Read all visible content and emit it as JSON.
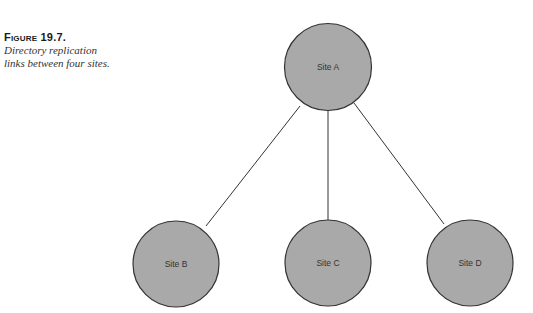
{
  "caption": {
    "figure_label": "Figure 19.7.",
    "text_line1": "Directory replication",
    "text_line2": "links between four sites."
  },
  "diagram": {
    "node_fill": "#a9a9a9",
    "node_stroke": "#333333",
    "nodes": [
      {
        "id": "A",
        "label": "Site A",
        "cx": 328,
        "cy": 67
      },
      {
        "id": "B",
        "label": "Site B",
        "cx": 176,
        "cy": 264
      },
      {
        "id": "C",
        "label": "Site C",
        "cx": 328,
        "cy": 263
      },
      {
        "id": "D",
        "label": "Site D",
        "cx": 470,
        "cy": 263
      }
    ],
    "links": [
      {
        "from": "A",
        "to": "B"
      },
      {
        "from": "A",
        "to": "C"
      },
      {
        "from": "A",
        "to": "D"
      }
    ]
  }
}
